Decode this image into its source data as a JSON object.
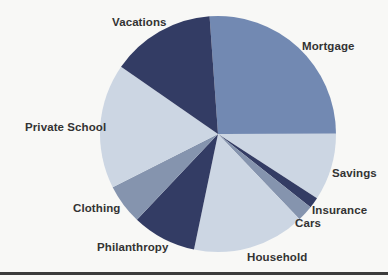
{
  "chart_data": {
    "type": "pie",
    "title": "",
    "legend": "none",
    "start_angle_deg": -4.1,
    "direction": "clockwise",
    "slices": [
      {
        "label": "Mortgage",
        "percent": 26.1,
        "color": "#7289b2"
      },
      {
        "label": "Savings",
        "percent": 9.2,
        "color": "#ccd6e3"
      },
      {
        "label": "Insurance",
        "percent": 1.5,
        "color": "#333c64"
      },
      {
        "label": "Cars",
        "percent": 2.2,
        "color": "#8594ae"
      },
      {
        "label": "Household",
        "percent": 15.4,
        "color": "#ccd6e3"
      },
      {
        "label": "Philanthropy",
        "percent": 8.8,
        "color": "#333c64"
      },
      {
        "label": "Clothing",
        "percent": 5.5,
        "color": "#8594ae"
      },
      {
        "label": "Private School",
        "percent": 17.1,
        "color": "#ccd6e3"
      },
      {
        "label": "Vacations",
        "percent": 14.2,
        "color": "#333c64"
      }
    ],
    "palette": {
      "dark_navy": "#333c64",
      "medium_blue": "#7289b2",
      "pale_blue": "#ccd6e3",
      "gray_blue": "#8594ae"
    }
  },
  "decorations": {
    "bottom_rule_color": "#3b3b3b"
  }
}
